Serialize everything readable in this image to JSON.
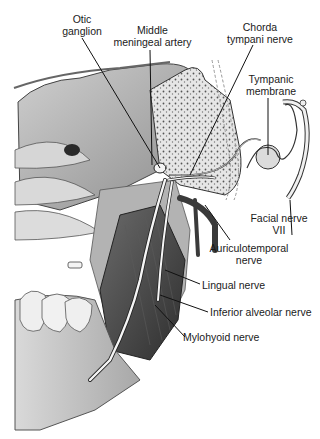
{
  "figure": {
    "style": "grayscale medical illustration"
  },
  "labels": {
    "otic_ganglion": {
      "line1": "Otic",
      "line2": "ganglion"
    },
    "middle_meningeal_artery": {
      "line1": "Middle",
      "line2": "meningeal artery"
    },
    "chorda_tympani_nerve": {
      "line1": "Chorda",
      "line2": "tympani nerve"
    },
    "tympanic_membrane": {
      "line1": "Tympanic",
      "line2": "membrane"
    },
    "facial_nerve": {
      "line1": "Facial nerve",
      "line2": "VII"
    },
    "auriculotemporal_nerve": {
      "line1": "Auriculotemporal",
      "line2": "nerve"
    },
    "lingual_nerve": {
      "line1": "Lingual nerve"
    },
    "inferior_alveolar_nerve": {
      "line1": "Inferior alveolar nerve"
    },
    "mylohyoid_nerve": {
      "line1": "Mylohyoid nerve"
    }
  },
  "colors": {
    "text": "#1a1a1a",
    "leader": "#111111",
    "bone_light": "#e4e4e4",
    "tissue_mid": "#9a9a9a",
    "muscle_dark": "#4a4a4a",
    "vessel": "#3a3a3a"
  }
}
